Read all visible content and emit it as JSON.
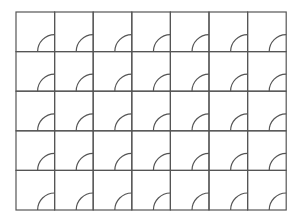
{
  "diagram": {
    "type": "door-swing-grid",
    "rows": 5,
    "columns": 7,
    "origin": {
      "x": 16,
      "y": 12
    },
    "cell_width": 38.6,
    "cell_height": 39.6,
    "arc_radius": 17,
    "arc_position": "bottom-right",
    "line_color": "#555555",
    "background": "#ffffff"
  }
}
